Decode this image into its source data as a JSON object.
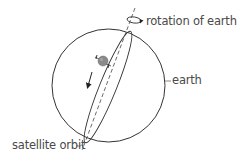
{
  "diagram": {
    "type": "satellite-polar-orbit",
    "labels": {
      "rotation": "rotation of earth",
      "earth": "earth",
      "orbit": "satellite orbit"
    },
    "colors": {
      "stroke": "#333333",
      "text": "#4a4a4a",
      "satellite": "#8a8a8a",
      "background": "#ffffff"
    }
  }
}
